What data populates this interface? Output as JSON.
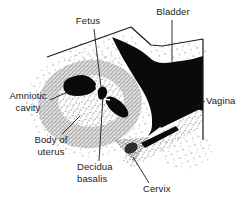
{
  "figure": {
    "type": "medical-line-diagram",
    "colors": {
      "background": "#ffffff",
      "ink": "#1b1b1b"
    },
    "labels": {
      "fetus": "Fetus",
      "bladder": "Bladder",
      "amniotic_cavity": "Amniotic\ncavity",
      "vagina": "Vagina",
      "body_of_uterus": "Body of\nuterus",
      "decidua_basalis": "Decidua\nbasalis",
      "cervix": "Cervix"
    }
  }
}
